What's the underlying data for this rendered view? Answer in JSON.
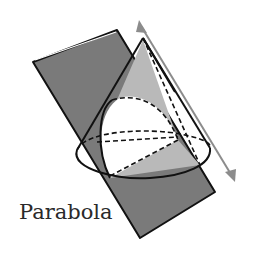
{
  "figure": {
    "caption": "Parabola",
    "colors": {
      "plane": "#7a7a7a",
      "cone_shade": "#b9b9b9",
      "section": "#ffffff",
      "arrow": "#8c8c8c",
      "outline": "#111111"
    },
    "parts": [
      "cutting-plane",
      "cone",
      "parabola-section",
      "parallel-arrow"
    ]
  }
}
